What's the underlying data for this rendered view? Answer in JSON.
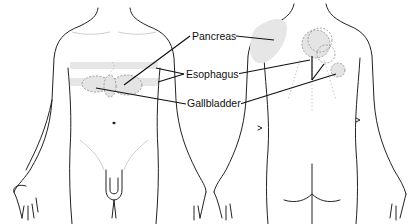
{
  "figure": {
    "views": [
      {
        "name": "anterior",
        "label": "Front view"
      },
      {
        "name": "posterior",
        "label": "Back view"
      }
    ],
    "labels": {
      "pancreas": "Pancreas",
      "esophagus": "Esophagus",
      "gallbladder": "Gallbladder"
    },
    "colors": {
      "outline": "#222222",
      "region_fill": "#e4e4e4",
      "leader": "#111111",
      "background": "#ffffff"
    }
  }
}
